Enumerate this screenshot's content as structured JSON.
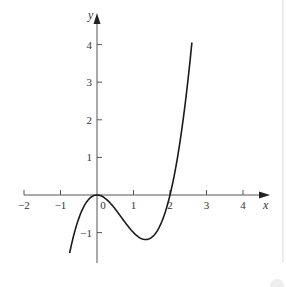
{
  "chart_data": {
    "type": "line",
    "title": "",
    "xlabel": "x",
    "ylabel": "y",
    "xlim": [
      -2,
      4.8
    ],
    "ylim": [
      -1.9,
      4.9
    ],
    "x_ticks": [
      -2,
      -1,
      0,
      1,
      2,
      3,
      4
    ],
    "x_tick_labels": [
      "−2",
      "−1",
      "0",
      "1",
      "2",
      "3",
      "4"
    ],
    "y_ticks": [
      -1,
      1,
      2,
      3,
      4
    ],
    "y_tick_labels": [
      "−1",
      "1",
      "2",
      "3",
      "4"
    ],
    "grid": false,
    "legend": null,
    "series": [
      {
        "name": "y = x^3 - 2x^2",
        "function": "x^3 - 2x^2",
        "x_range": [
          -0.75,
          2.6
        ],
        "key_points": [
          {
            "x": -0.75,
            "y": -1.55
          },
          {
            "x": 0,
            "y": 0,
            "note": "local max"
          },
          {
            "x": 1.33,
            "y": -1.19,
            "note": "local min"
          },
          {
            "x": 2,
            "y": 0,
            "note": "root"
          },
          {
            "x": 2.6,
            "y": 4.06
          }
        ],
        "color": "#1a1a1a"
      }
    ]
  },
  "colors": {
    "axis": "#555555",
    "curve": "#1a1a1a",
    "text": "#333333"
  }
}
